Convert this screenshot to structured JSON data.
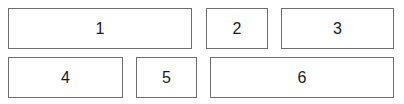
{
  "boxes": [
    {
      "label": "1"
    },
    {
      "label": "2"
    },
    {
      "label": "3"
    },
    {
      "label": "4"
    },
    {
      "label": "5"
    },
    {
      "label": "6"
    }
  ]
}
